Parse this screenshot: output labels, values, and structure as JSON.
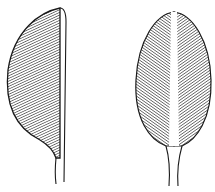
{
  "figure": {
    "leaves": [
      {
        "name": "half-leaf",
        "description": "Asymmetric leaf showing one blade half beside a midrib"
      },
      {
        "name": "whole-leaf",
        "description": "Oval leaf with white midrib and pinnate hatching"
      }
    ],
    "colors": {
      "ink": "#1a1a1a",
      "paper": "#ffffff"
    }
  }
}
